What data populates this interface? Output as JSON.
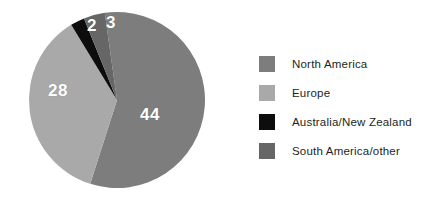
{
  "chart_data": {
    "type": "pie",
    "title": "",
    "subtitle": "",
    "xlabel": "",
    "ylabel": "",
    "grid": false,
    "legend_position": "right",
    "total": 77,
    "units": "percent",
    "start_angle_deg": -8,
    "direction": "clockwise",
    "categories": [
      "North America",
      "Europe",
      "Australia/New Zealand",
      "South America/other"
    ],
    "values": [
      44,
      28,
      2,
      3
    ],
    "colors": [
      "#7d7d7d",
      "#a9a9a9",
      "#0d0d0d",
      "#666666"
    ],
    "slices": [
      {
        "label": "North America",
        "value": 44,
        "value_text": "44",
        "color": "#7d7d7d",
        "start_deg": -8,
        "end_deg": 217.4
      },
      {
        "label": "Europe",
        "value": 28,
        "value_text": "28",
        "color": "#a9a9a9",
        "start_deg": 217.4,
        "end_deg": 348.3
      },
      {
        "label": "Australia/New Zealand",
        "value": 2,
        "value_text": "2",
        "color": "#0d0d0d",
        "start_deg": 348.3,
        "end_deg": 357.7
      },
      {
        "label": "South America/other",
        "value": 3,
        "value_text": "3",
        "color": "#666666",
        "start_deg": 357.7,
        "end_deg": 352.0
      }
    ]
  },
  "pie": {
    "center_x": 117,
    "center_y": 100,
    "radius": 88,
    "labels": [
      {
        "text": "44"
      },
      {
        "text": "28"
      },
      {
        "text": "2"
      },
      {
        "text": "3"
      }
    ]
  },
  "legend": {
    "items": [
      {
        "label": "North America",
        "color": "#7d7d7d"
      },
      {
        "label": "Europe",
        "color": "#a9a9a9"
      },
      {
        "label": "Australia/New Zealand",
        "color": "#0d0d0d"
      },
      {
        "label": "South America/other",
        "color": "#666666"
      }
    ]
  },
  "colors": {
    "background": "#ffffff",
    "text": "#231f20",
    "label_text": "#ffffff"
  }
}
